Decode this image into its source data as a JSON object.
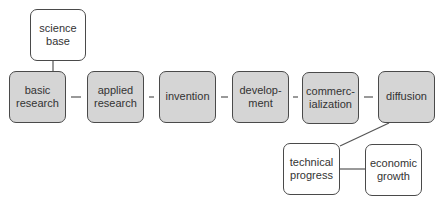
{
  "diagram": {
    "colors": {
      "process_fill": "#d5d5d5",
      "outcome_fill": "#ffffff",
      "stroke": "#4a4a4a",
      "text": "#333333"
    },
    "input": {
      "label": "science\nbase"
    },
    "stages": [
      {
        "label": "basic\nresearch"
      },
      {
        "label": "applied\nresearch"
      },
      {
        "label": "invention"
      },
      {
        "label": "develop-\nment"
      },
      {
        "label": "commerc-\nialization"
      },
      {
        "label": "diffusion"
      }
    ],
    "outcomes": [
      {
        "label": "technical\nprogress"
      },
      {
        "label": "economic\ngrowth"
      }
    ]
  }
}
